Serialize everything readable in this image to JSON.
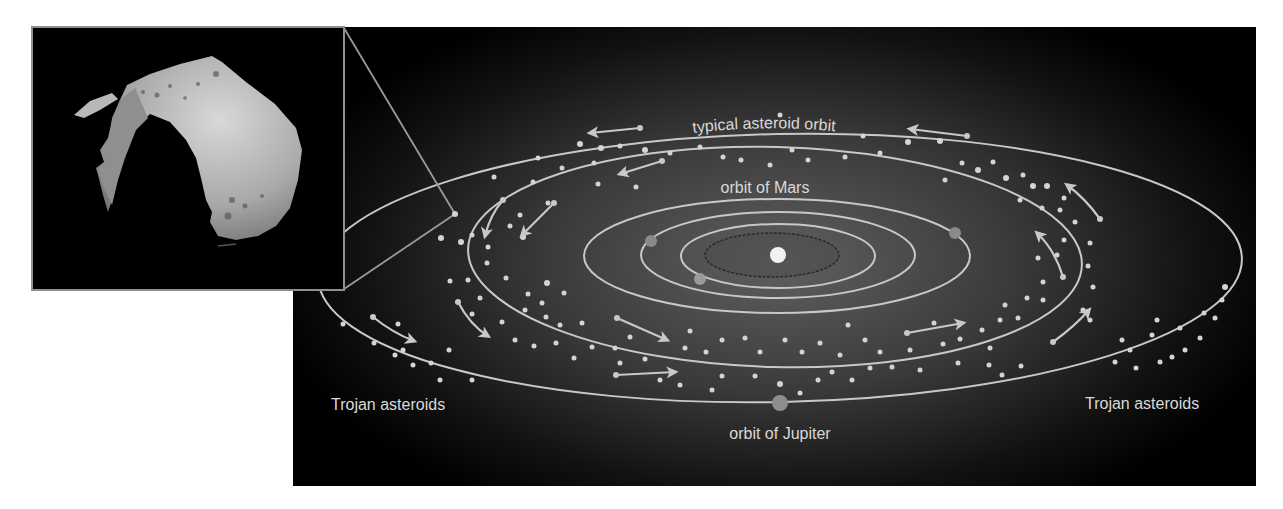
{
  "labels": {
    "asteroid_orbit": "typical asteroid orbit",
    "mars_orbit": "orbit of Mars",
    "jupiter_orbit": "orbit of Jupiter",
    "trojan_left": "Trojan asteroids",
    "trojan_right": "Trojan asteroids"
  },
  "colors": {
    "panel_center": "#5c5c5c",
    "panel_edge": "#000000",
    "orbit_line": "#c8c8c8",
    "dot": "#d4d4d4",
    "sun": "#f2f2f2",
    "planet": "#8a8a8a",
    "callout": "#9a9a9a"
  },
  "inset": {
    "description": "photo of an irregular asteroid"
  },
  "diagram": {
    "sun": {
      "cx": 778,
      "cy": 255,
      "r": 8
    },
    "orbits": [
      {
        "name": "mercury-orbit",
        "cx": 772,
        "cy": 255,
        "rx": 67,
        "ry": 22,
        "style": "dark"
      },
      {
        "name": "venus-orbit",
        "cx": 778,
        "cy": 256,
        "rx": 97,
        "ry": 32
      },
      {
        "name": "earth-orbit",
        "cx": 778,
        "cy": 255,
        "rx": 137,
        "ry": 43
      },
      {
        "name": "mars-orbit",
        "cx": 777,
        "cy": 256,
        "rx": 193,
        "ry": 57
      },
      {
        "name": "asteroid-orbit",
        "cx": 775,
        "cy": 257,
        "rx": 307,
        "ry": 110,
        "rot": 1.5
      },
      {
        "name": "jupiter-orbit",
        "cx": 780,
        "cy": 268,
        "rx": 462,
        "ry": 134,
        "rot": -1.2
      }
    ],
    "planets": [
      {
        "name": "venus",
        "cx": 700,
        "cy": 279,
        "r": 6
      },
      {
        "name": "earth",
        "cx": 651,
        "cy": 241,
        "r": 6
      },
      {
        "name": "mars",
        "cx": 955,
        "cy": 233,
        "r": 6
      },
      {
        "name": "jupiter",
        "cx": 780,
        "cy": 403,
        "r": 8
      }
    ]
  }
}
